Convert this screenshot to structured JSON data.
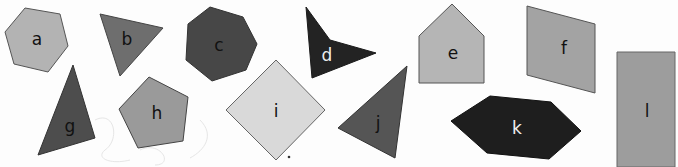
{
  "worksheet": {
    "heading_visible": false,
    "shapes": [
      {
        "id": "a",
        "label": "a",
        "kind": "hexagon",
        "fill": "#b3b3b3",
        "stroke": "#555555",
        "text_color": "#111111"
      },
      {
        "id": "b",
        "label": "b",
        "kind": "triangle",
        "fill": "#6e6e6e",
        "stroke": "#444444",
        "text_color": "#111111"
      },
      {
        "id": "c",
        "label": "c",
        "kind": "heptagon",
        "fill": "#474747",
        "stroke": "#333333",
        "text_color": "#111111"
      },
      {
        "id": "d",
        "label": "d",
        "kind": "concave-quadrilateral",
        "fill": "#232323",
        "stroke": "#1a1a1a",
        "text_color": "#eeeeee"
      },
      {
        "id": "e",
        "label": "e",
        "kind": "pentagon",
        "fill": "#b5b5b5",
        "stroke": "#555555",
        "text_color": "#111111"
      },
      {
        "id": "f",
        "label": "f",
        "kind": "parallelogram",
        "fill": "#a3a3a3",
        "stroke": "#555555",
        "text_color": "#111111"
      },
      {
        "id": "g",
        "label": "g",
        "kind": "triangle",
        "fill": "#4d4d4d",
        "stroke": "#333333",
        "text_color": "#111111"
      },
      {
        "id": "h",
        "label": "h",
        "kind": "pentagon",
        "fill": "#9a9a9a",
        "stroke": "#444444",
        "text_color": "#111111"
      },
      {
        "id": "i",
        "label": "i",
        "kind": "square",
        "fill": "#d9d9d9",
        "stroke": "#666666",
        "text_color": "#111111"
      },
      {
        "id": "j",
        "label": "j",
        "kind": "triangle",
        "fill": "#555555",
        "stroke": "#333333",
        "text_color": "#111111"
      },
      {
        "id": "k",
        "label": "k",
        "kind": "hexagon",
        "fill": "#1e1e1e",
        "stroke": "#111111",
        "text_color": "#eeeeee"
      },
      {
        "id": "l",
        "label": "l",
        "kind": "rectangle",
        "fill": "#9d9d9d",
        "stroke": "#666666",
        "text_color": "#111111"
      }
    ]
  }
}
